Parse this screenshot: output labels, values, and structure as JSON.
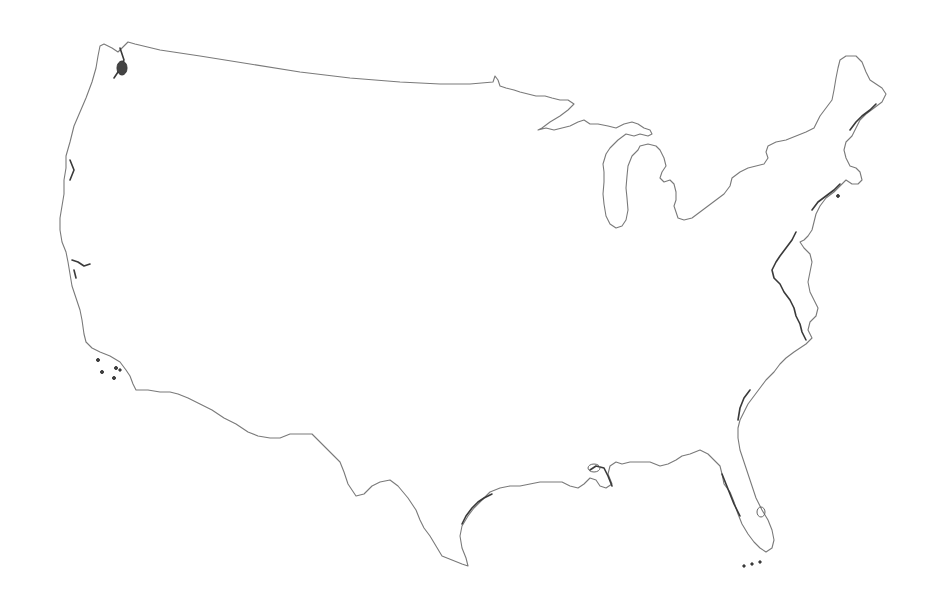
{
  "map": {
    "title": "Contiguous United States outline",
    "background": "#ffffff",
    "stroke_color": "#7a7a7a",
    "dense_coast_color": "#3a3a3a",
    "outline_path": "M100,46 L104,44 L112,48 L118,52 L124,46 L128,42 L135,44 L160,50 L200,56 L250,64 L300,72 L350,78 L400,82 L440,84 L470,84 L493,82 L495,76 L498,80 L500,86 L506,88 L514,90 L520,92 L528,94 L536,96 L545,96 L552,98 L560,100 L568,100 L574,104 L568,110 L560,116 L550,122 L542,128 L538,130 L546,128 L554,130 L562,128 L570,126 L578,122 L584,120 L590,124 L598,124 L608,126 L616,128 L624,124 L632,122 L638,124 L644,128 L650,130 L652,134 L648,136 L640,134 L634,136 L626,134 L618,140 L610,148 L606,154 L603,164 L604,172 L604,182 L603,194 L604,204 L606,216 L610,224 L616,228 L622,226 L626,220 L628,210 L627,198 L626,188 L627,176 L628,166 L632,156 L638,150 L640,146 L648,144 L656,146 L660,150 L664,158 L666,166 L662,172 L660,178 L664,182 L670,180 L674,184 L676,192 L676,200 L674,206 L676,212 L678,218 L684,220 L692,218 L700,212 L708,206 L716,200 L724,194 L730,186 L732,178 L740,172 L748,168 L756,166 L764,164 L768,158 L766,152 L768,146 L776,142 L786,140 L796,136 L806,132 L814,128 L820,116 L826,108 L832,100 L834,90 L836,78 L838,68 L840,60 L846,56 L856,56 L862,62 L866,72 L870,80 L876,84 L882,88 L886,94 L882,102 L874,108 L866,114 L860,120 L856,128 L852,136 L846,142 L844,150 L846,158 L850,166 L856,168 L860,172 L862,180 L858,184 L852,184 L846,180 L840,186 L834,192 L826,198 L820,206 L816,214 L814,222 L812,230 L808,236 L804,240 L800,242 L804,248 L810,254 L812,262 L810,272 L808,282 L810,292 L814,300 L818,308 L816,316 L810,322 L808,330 L812,338 L806,344 L800,348 L794,352 L786,358 L780,364 L774,372 L766,380 L760,388 L754,396 L748,404 L744,412 L740,420 L738,428 L738,438 L740,450 L744,462 L748,474 L752,486 L756,498 L762,510 L768,520 L772,530 L774,540 L772,548 L766,552 L760,548 L754,542 L748,534 L742,524 L738,514 L734,502 L730,492 L724,484 L722,474 L720,466 L714,460 L708,454 L700,450 L690,454 L682,456 L676,460 L668,464 L660,466 L650,462 L640,462 L630,462 L622,464 L616,462 L610,466 L608,474 L612,484 L606,488 L600,486 L596,480 L590,478 L584,484 L578,488 L570,486 L562,482 L556,482 L548,482 L540,482 L530,484 L520,486 L510,486 L500,488 L490,492 L482,500 L474,508 L468,516 L462,526 L460,536 L462,548 L466,558 L468,566 L462,564 L452,560 L442,556 L436,546 L430,536 L424,528 L420,520 L416,510 L408,498 L398,486 L390,480 L380,482 L372,486 L364,494 L356,496 L348,484 L344,472 L340,462 L334,456 L326,448 L318,440 L312,434 L300,434 L290,434 L280,438 L270,438 L258,436 L248,432 L236,424 L224,418 L212,410 L200,404 L188,398 L178,394 L170,392 L160,392 L148,390 L136,390 L133,384 L130,376 L126,370 L120,362 L110,356 L100,352 L92,348 L86,342 L84,334 L82,320 L80,310 L76,298 L72,286 L70,274 L68,262 L66,252 L62,242 L60,230 L60,218 L62,206 L64,194 L64,180 L66,168 L66,156 L70,142 L74,126 L80,112 L86,98 L92,82 L96,68 L98,56 Z",
    "dense_coasts": [
      "M120,48 L124,60 L118,72 L114,78 M70,160 L74,170 L70,180",
      "M72,260 L78,262 L84,266 L90,264 M74,270 L76,278",
      "M796,232 L792,240 L786,248 L780,256 L776,262 L772,270 L774,278 L780,284 L784,292 L790,300 L794,308 L796,316 L800,324 L802,332 L806,340",
      "M812,210 L818,202 L826,196 L834,190 L840,184",
      "M850,130 L856,122 L862,116 L870,110 L876,104",
      "M462,524 L466,516 L472,508 L478,502 L484,498 L492,494",
      "M590,470 L596,466 L604,468 L608,476 L612,486",
      "M738,420 L740,408 L744,398 L750,390",
      "M722,474 L726,484 L730,494 L734,504 L740,516"
    ],
    "islands": [
      {
        "type": "ellipse",
        "cx": 122,
        "cy": 68,
        "rx": 5,
        "ry": 7
      },
      {
        "type": "dot",
        "cx": 98,
        "cy": 360,
        "r": 1.5
      },
      {
        "type": "dot",
        "cx": 102,
        "cy": 372,
        "r": 1.5
      },
      {
        "type": "dot",
        "cx": 116,
        "cy": 368,
        "r": 1.5
      },
      {
        "type": "dot",
        "cx": 114,
        "cy": 378,
        "r": 1.5
      },
      {
        "type": "dot",
        "cx": 120,
        "cy": 370,
        "r": 1.2
      },
      {
        "type": "dot",
        "cx": 744,
        "cy": 566,
        "r": 1.2
      },
      {
        "type": "dot",
        "cx": 752,
        "cy": 564,
        "r": 1.2
      },
      {
        "type": "dot",
        "cx": 760,
        "cy": 562,
        "r": 1.2
      },
      {
        "type": "dot",
        "cx": 838,
        "cy": 196,
        "r": 1.4
      }
    ],
    "lakes": [
      {
        "name": "lake-okeechobee",
        "cx": 761,
        "cy": 512,
        "rx": 4,
        "ry": 5
      },
      {
        "name": "lake-pontchartrain",
        "cx": 594,
        "cy": 468,
        "rx": 6,
        "ry": 4
      }
    ]
  }
}
